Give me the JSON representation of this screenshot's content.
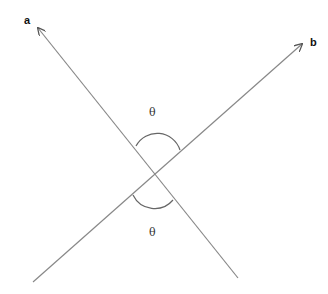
{
  "diagram": {
    "lines": [
      {
        "label": "a",
        "from": [
          238,
          278
        ],
        "to": [
          38,
          28
        ]
      },
      {
        "label": "b",
        "from": [
          33,
          282
        ],
        "to": [
          302,
          44
        ]
      }
    ],
    "intersection": [
      155,
      175
    ],
    "angle_label_top": "θ",
    "angle_label_bottom": "θ",
    "stroke_color": "#888888"
  }
}
